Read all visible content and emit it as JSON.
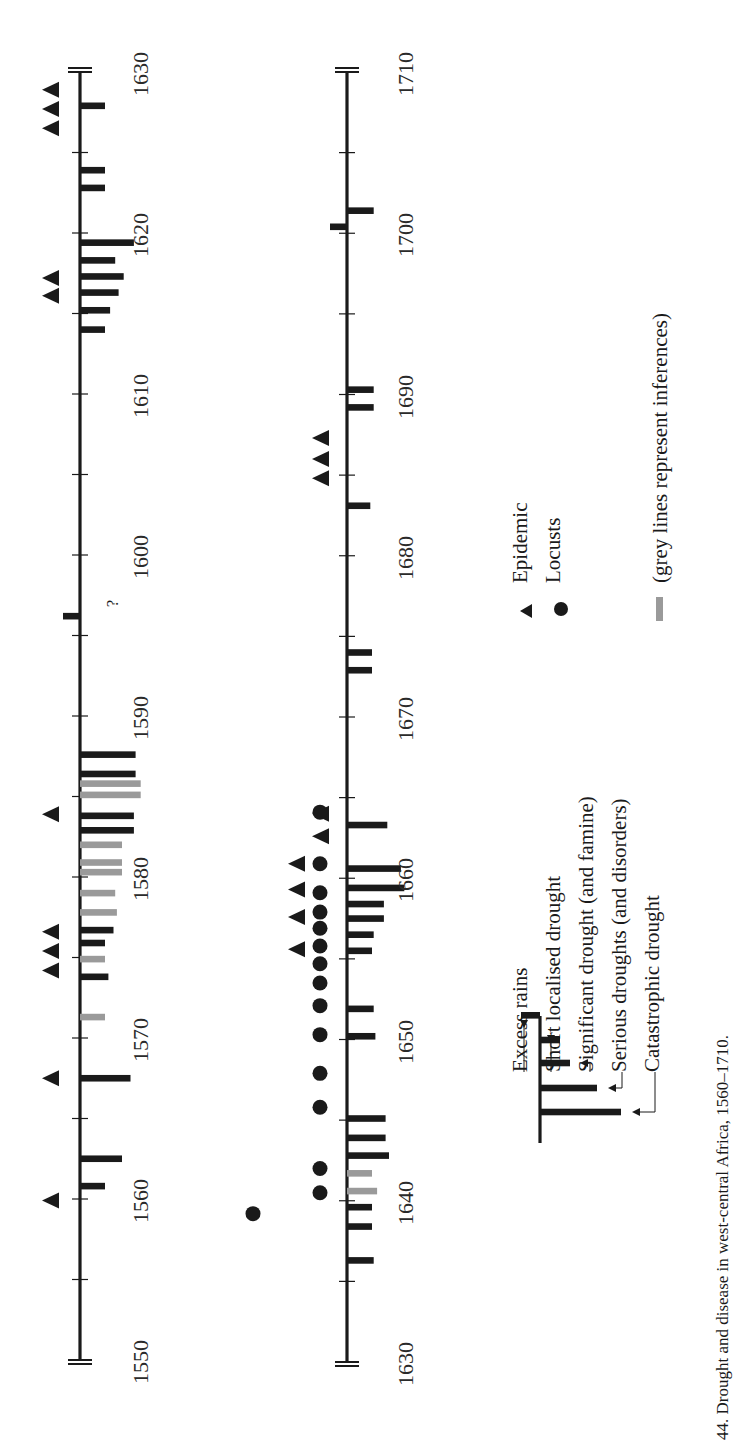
{
  "caption": "44.  Drought and disease in west-central Africa, 1560–1710.",
  "legend": {
    "bars": [
      {
        "label": "Excess rains",
        "level": -1
      },
      {
        "label": "Short localised drought",
        "level": 1
      },
      {
        "label": "Significant drought (and famine)",
        "level": 2
      },
      {
        "label": "Serious droughts (and disorders)",
        "level": 3
      },
      {
        "label": "Catastrophic drought",
        "level": 4
      }
    ],
    "epidemic": "Epidemic",
    "locusts": "Locusts",
    "grey_note": "(grey lines represent inferences)"
  },
  "colors": {
    "ink": "#1a1a1a",
    "grey": "#9a9a9a"
  },
  "chart_data": {
    "type": "timeline",
    "title": "Drought and disease in west-central Africa, 1560–1710",
    "axes": [
      {
        "range": [
          1550,
          1630
        ],
        "tick_every": 5,
        "labels": [
          1550,
          1560,
          1570,
          1580,
          1590,
          1600,
          1610,
          1620,
          1630
        ],
        "droughts": [
          {
            "year": 1560.8,
            "level": 1,
            "inferred": false
          },
          {
            "year": 1562.5,
            "level": 2,
            "inferred": false
          },
          {
            "year": 1567.5,
            "level": 2.5,
            "inferred": false
          },
          {
            "year": 1571.3,
            "level": 1,
            "inferred": true
          },
          {
            "year": 1573.8,
            "level": 1.2,
            "inferred": false
          },
          {
            "year": 1574.9,
            "level": 1,
            "inferred": true
          },
          {
            "year": 1575.9,
            "level": 1,
            "inferred": false
          },
          {
            "year": 1576.7,
            "level": 1.5,
            "inferred": false
          },
          {
            "year": 1577.8,
            "level": 1.7,
            "inferred": true
          },
          {
            "year": 1579.0,
            "level": 1.6,
            "inferred": true
          },
          {
            "year": 1580.3,
            "level": 2.0,
            "inferred": true
          },
          {
            "year": 1580.9,
            "level": 2.0,
            "inferred": true
          },
          {
            "year": 1582.0,
            "level": 2.0,
            "inferred": true
          },
          {
            "year": 1582.9,
            "level": 2.7,
            "inferred": false
          },
          {
            "year": 1583.8,
            "level": 2.7,
            "inferred": false
          },
          {
            "year": 1585.1,
            "level": 3.1,
            "inferred": true
          },
          {
            "year": 1585.8,
            "level": 3.1,
            "inferred": true
          },
          {
            "year": 1586.4,
            "level": 2.8,
            "inferred": false
          },
          {
            "year": 1587.6,
            "level": 2.8,
            "inferred": false
          },
          {
            "year": 1614.0,
            "level": 1,
            "inferred": false
          },
          {
            "year": 1615.2,
            "level": 1.3,
            "inferred": false
          },
          {
            "year": 1616.3,
            "level": 1.8,
            "inferred": false
          },
          {
            "year": 1617.3,
            "level": 2.1,
            "inferred": false
          },
          {
            "year": 1618.3,
            "level": 1.6,
            "inferred": false
          },
          {
            "year": 1619.4,
            "level": 2.7,
            "inferred": false
          },
          {
            "year": 1622.8,
            "level": 1,
            "inferred": false,
            "note": "?"
          },
          {
            "year": 1623.9,
            "level": 1,
            "inferred": false,
            "note": "?"
          },
          {
            "year": 1627.9,
            "level": 1,
            "inferred": false
          }
        ],
        "excess_rains": [
          {
            "year": 1596.2
          }
        ],
        "epidemics": [
          1559.9,
          1567.5,
          1574.2,
          1575.4,
          1576.6,
          1583.9,
          1616.1,
          1617.2,
          1626.5,
          1627.7,
          1628.9
        ],
        "locusts": []
      },
      {
        "range": [
          1630,
          1710
        ],
        "tick_every": 5,
        "labels": [
          1630,
          1640,
          1650,
          1660,
          1670,
          1680,
          1690,
          1700,
          1710
        ],
        "droughts": [
          {
            "year": 1636.3,
            "level": 1.1,
            "inferred": false
          },
          {
            "year": 1638.4,
            "level": 1,
            "inferred": false
          },
          {
            "year": 1639.6,
            "level": 1,
            "inferred": false
          },
          {
            "year": 1640.6,
            "level": 1.3,
            "inferred": true
          },
          {
            "year": 1641.7,
            "level": 1,
            "inferred": true
          },
          {
            "year": 1642.8,
            "level": 2,
            "inferred": false
          },
          {
            "year": 1643.9,
            "level": 1.8,
            "inferred": false
          },
          {
            "year": 1645.1,
            "level": 1.8,
            "inferred": false
          },
          {
            "year": 1650.2,
            "level": 1.2,
            "inferred": false
          },
          {
            "year": 1651.9,
            "level": 1.1,
            "inferred": false
          },
          {
            "year": 1655.5,
            "level": 1,
            "inferred": false
          },
          {
            "year": 1656.5,
            "level": 1.1,
            "inferred": false
          },
          {
            "year": 1657.5,
            "level": 1.7,
            "inferred": false
          },
          {
            "year": 1658.4,
            "level": 1.7,
            "inferred": false
          },
          {
            "year": 1659.4,
            "level": 2.9,
            "inferred": false
          },
          {
            "year": 1660.6,
            "level": 2.7,
            "inferred": false
          },
          {
            "year": 1663.3,
            "level": 1.9,
            "inferred": false
          },
          {
            "year": 1672.9,
            "level": 1,
            "inferred": false
          },
          {
            "year": 1674.0,
            "level": 1,
            "inferred": false
          },
          {
            "year": 1683.1,
            "level": 0.9,
            "inferred": false
          },
          {
            "year": 1689.2,
            "level": 1.1,
            "inferred": false
          },
          {
            "year": 1690.3,
            "level": 1.1,
            "inferred": false
          },
          {
            "year": 1701.4,
            "level": 1.1,
            "inferred": false
          }
        ],
        "excess_rains": [
          {
            "year": 1700.4
          }
        ],
        "epidemics": [
          1655.6,
          1657.6,
          1659.3,
          1660.9,
          1662.6,
          1664.0,
          1684.8,
          1686.0,
          1687.3
        ],
        "locusts": [
          1640.5,
          1642.0,
          1645.8,
          1647.9,
          1650.3,
          1652.1,
          1653.5,
          1654.7,
          1655.8,
          1656.9,
          1657.9,
          1659.1,
          1660.9,
          1664.1
        ],
        "locusts_outer": [
          1639.2
        ]
      }
    ]
  }
}
